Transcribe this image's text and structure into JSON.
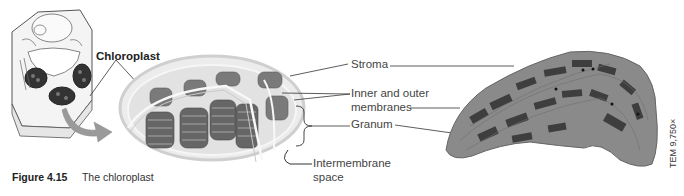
{
  "figure": {
    "number": "Figure 4.15",
    "title": "The chloroplast"
  },
  "labels": {
    "chloroplast": "Chloroplast",
    "stroma": "Stroma",
    "membranes_line1": "Inner and outer",
    "membranes_line2": "membranes",
    "granum": "Granum",
    "intermembrane_line1": "Intermembrane",
    "intermembrane_line2": "space"
  },
  "micrograph": {
    "magnification": "TEM 9,750×"
  },
  "colors": {
    "background": "#ffffff",
    "membrane": "#d8d8d8",
    "thylakoid": "#6b6b6b",
    "micrograph": "#7a7a7a",
    "leader_line": "#333333"
  }
}
